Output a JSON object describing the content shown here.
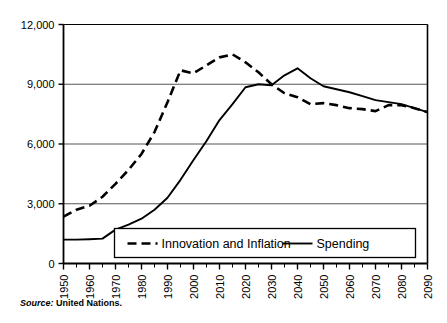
{
  "chart_data": {
    "type": "line",
    "title": "",
    "subtitle": "",
    "xlabel": "",
    "ylabel": "",
    "xlim": [
      1950,
      2090
    ],
    "ylim": [
      0,
      12000
    ],
    "grid": true,
    "grid_axis": "y",
    "legend_position": "bottom-inside",
    "y_ticks": [
      0,
      3000,
      6000,
      9000,
      12000
    ],
    "y_tick_labels": [
      "0",
      "3,000",
      "6,000",
      "9,000",
      "12,000"
    ],
    "x_ticks": [
      1950,
      1960,
      1970,
      1980,
      1990,
      2000,
      2010,
      2020,
      2030,
      2040,
      2050,
      2060,
      2070,
      2080,
      2090
    ],
    "x_tick_labels": [
      "1950",
      "1960",
      "1970",
      "1980",
      "1990",
      "2000",
      "2010",
      "2020",
      "2030",
      "2040",
      "2050",
      "2060",
      "2070",
      "2080",
      "2090"
    ],
    "x_minor_tick_interval": 5,
    "x": [
      1950,
      1955,
      1960,
      1965,
      1970,
      1975,
      1980,
      1985,
      1990,
      1995,
      2000,
      2005,
      2010,
      2015,
      2020,
      2025,
      2030,
      2035,
      2040,
      2045,
      2050,
      2055,
      2060,
      2065,
      2070,
      2075,
      2080,
      2085,
      2090
    ],
    "series": [
      {
        "name": "Innovation and Inflation",
        "style": "dashed",
        "color": "#000000",
        "values": [
          2350,
          2700,
          2900,
          3350,
          4000,
          4700,
          5500,
          6600,
          8100,
          9700,
          9550,
          9950,
          10350,
          10500,
          10100,
          9600,
          9000,
          8550,
          8350,
          8000,
          8050,
          7950,
          7800,
          7750,
          7650,
          7950,
          7950,
          7800,
          7600
        ]
      },
      {
        "name": "Spending",
        "style": "solid",
        "color": "#000000",
        "values": [
          1200,
          1200,
          1220,
          1250,
          1700,
          1950,
          2250,
          2700,
          3300,
          4200,
          5200,
          6150,
          7200,
          8000,
          8850,
          9000,
          8950,
          9450,
          9800,
          9300,
          8900,
          8750,
          8600,
          8400,
          8200,
          8100,
          8000,
          7800,
          7600
        ]
      }
    ],
    "legend": [
      {
        "label": "Innovation and Inflation",
        "style": "dashed"
      },
      {
        "label": "Spending",
        "style": "solid"
      }
    ]
  },
  "source": {
    "lead": "Source:",
    "text": " United Nations."
  }
}
